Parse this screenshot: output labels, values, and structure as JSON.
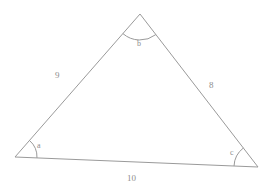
{
  "figure": {
    "type": "triangle-diagram",
    "background_color": "#ffffff",
    "stroke_color": "#9a9a9a",
    "text_color": "#8d8d8d",
    "stroke_width": 1,
    "vertices": {
      "a": {
        "name": "left-vertex",
        "x": 15,
        "y": 157
      },
      "b": {
        "name": "top-vertex",
        "x": 140,
        "y": 14
      },
      "c": {
        "name": "right-vertex",
        "x": 258,
        "y": 167
      }
    },
    "sides": [
      {
        "id": "side-left",
        "label": "9",
        "from": "a",
        "to": "b",
        "label_x": 55,
        "label_y": 71
      },
      {
        "id": "side-right",
        "label": "8",
        "from": "b",
        "to": "c",
        "label_x": 209,
        "label_y": 81
      },
      {
        "id": "side-base",
        "label": "10",
        "from": "a",
        "to": "c",
        "label_x": 127,
        "label_y": 174
      }
    ],
    "angles": [
      {
        "id": "angle-a",
        "label": "a",
        "vertex": "a",
        "arc_radius": 22,
        "label_x": 37,
        "label_y": 142
      },
      {
        "id": "angle-b",
        "label": "b",
        "vertex": "b",
        "arc_radius": 26,
        "label_x": 137,
        "label_y": 40
      },
      {
        "id": "angle-c",
        "label": "c",
        "vertex": "c",
        "arc_radius": 24,
        "label_x": 230,
        "label_y": 149
      }
    ]
  }
}
